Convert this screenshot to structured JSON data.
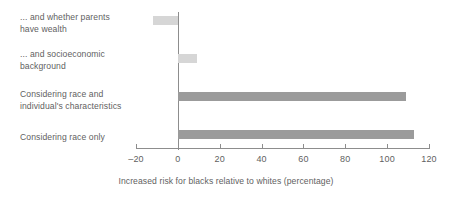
{
  "chart_data": {
    "type": "bar",
    "orientation": "horizontal",
    "title": "",
    "subtitle": "",
    "xlabel": "Increased risk for blacks relative to whites (percentage)",
    "ylabel": "",
    "xlim": [
      -20,
      120
    ],
    "xticks": [
      -20,
      0,
      20,
      40,
      60,
      80,
      100,
      120
    ],
    "xtick_labels": [
      "–20",
      "0",
      "20",
      "40",
      "60",
      "80",
      "100",
      "120"
    ],
    "grid": false,
    "legend": null,
    "zero_reference_line": 0,
    "categories": [
      "... and whether parents\nhave wealth",
      "... and socioeconomic\nbackground",
      "Considering race and\nindividual's characteristics",
      "Considering race only"
    ],
    "values": [
      -12,
      9,
      109,
      113
    ],
    "bar_colors": [
      "#d6d6d6",
      "#d6d6d6",
      "#9b9b9b",
      "#9b9b9b"
    ],
    "bars": [
      {
        "label": "... and whether parents\nhave wealth",
        "value": -12,
        "color": "#d6d6d6",
        "shade": "light"
      },
      {
        "label": "... and socioeconomic\nbackground",
        "value": 9,
        "color": "#d6d6d6",
        "shade": "light"
      },
      {
        "label": "Considering race and\nindividual's characteristics",
        "value": 109,
        "color": "#9b9b9b",
        "shade": "dark"
      },
      {
        "label": "Considering race only",
        "value": 113,
        "color": "#9b9b9b",
        "shade": "dark"
      }
    ]
  },
  "colors": {
    "light_bar": "#d6d6d6",
    "dark_bar": "#9b9b9b",
    "axis": "#8d8d8d",
    "text": "#5f5f5f",
    "background": "#ffffff"
  }
}
